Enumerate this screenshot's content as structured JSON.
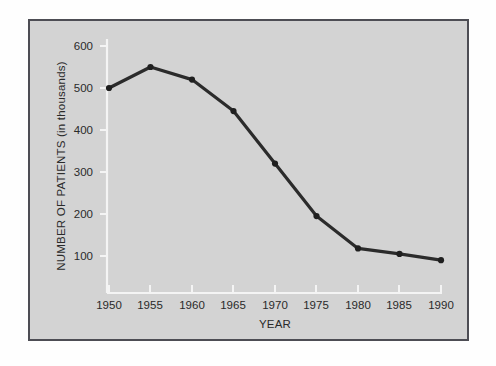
{
  "figure": {
    "background_color": "#fefefe",
    "plot_background_color": "#d3d3d3",
    "frame_border_color": "#4d4d54",
    "axis_color": "#f4f4f4",
    "series_color": "#2b2b2b"
  },
  "chart_data": {
    "type": "line",
    "title": "",
    "xlabel": "YEAR",
    "ylabel": "NUMBER OF PATIENTS (in thousands)",
    "x": [
      1950,
      1955,
      1960,
      1965,
      1970,
      1975,
      1980,
      1985,
      1990
    ],
    "xtick_labels": [
      "1950",
      "1955",
      "1960",
      "1965",
      "1970",
      "1975",
      "1980",
      "1985",
      "1990"
    ],
    "values": [
      500,
      550,
      520,
      445,
      320,
      195,
      118,
      105,
      90
    ],
    "ytick_values": [
      100,
      200,
      300,
      400,
      500,
      600
    ],
    "ytick_labels": [
      "100",
      "200",
      "300",
      "400",
      "500",
      "600"
    ],
    "xlim": [
      1948.5,
      1991.5
    ],
    "ylim": [
      0,
      620
    ],
    "grid": false,
    "legend": null,
    "markers": "circle",
    "series": [
      {
        "name": "Number of patients",
        "values": [
          500,
          550,
          520,
          445,
          320,
          195,
          118,
          105,
          90
        ]
      }
    ]
  }
}
